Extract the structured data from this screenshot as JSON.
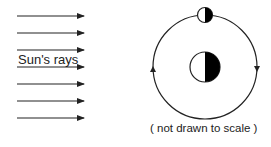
{
  "diagram": {
    "rays_label": "Sun's rays",
    "caption": "( not drawn to scale )",
    "ray_count": 7,
    "elements": {
      "sun_rays": {
        "direction": "left-to-right",
        "y_positions": [
          16,
          33,
          50,
          67,
          84,
          101,
          118
        ]
      },
      "orbit": {
        "center": [
          205,
          67
        ],
        "radius": 52,
        "direction_left": "up",
        "direction_right": "down"
      },
      "earth": {
        "center": [
          205,
          67
        ],
        "radius": 15,
        "lit_side": "left",
        "dark_side": "right"
      },
      "moon": {
        "center": [
          205,
          15
        ],
        "radius": 7,
        "lit_side": "left",
        "dark_side": "right"
      }
    },
    "colors": {
      "line": "#222222",
      "dark": "#000000",
      "lit": "#ffffff"
    }
  }
}
